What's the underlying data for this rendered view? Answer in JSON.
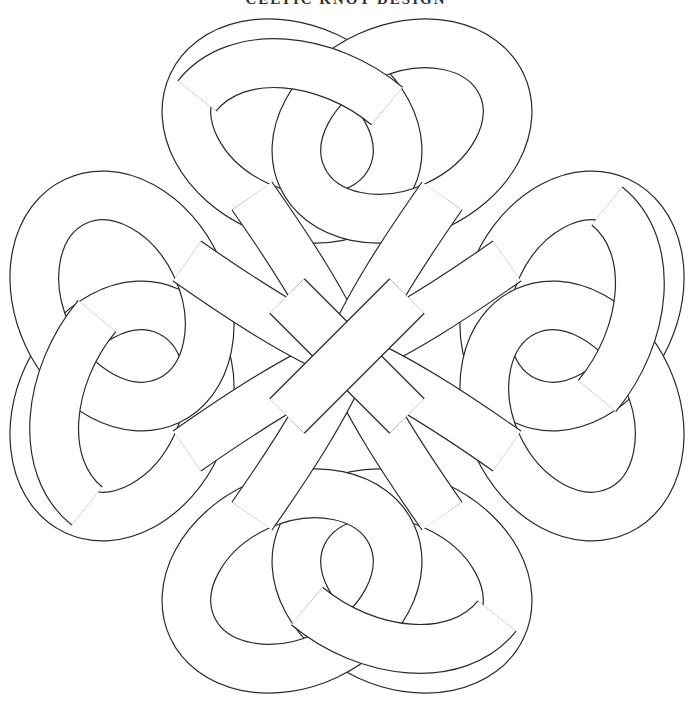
{
  "page": {
    "title": "CELTIC KNOT DESIGN",
    "background": "#ffffff",
    "line_color": "#2a2a2a"
  },
  "artwork": {
    "type": "celtic-knot-coloring-page",
    "center": [
      347,
      356
    ],
    "lobes": [
      "top",
      "left",
      "right",
      "bottom"
    ],
    "band_width_px": 48
  }
}
